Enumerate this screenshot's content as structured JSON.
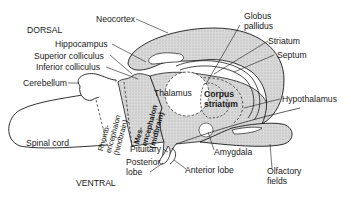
{
  "orientation": {
    "dorsal": "DORSAL",
    "ventral": "VENTRAL"
  },
  "labels": {
    "neocortex": "Neocortex",
    "hippocampus": "Hippocampus",
    "superior_colliculus": "Superior colliculus",
    "inferior_colliculus": "Inferior colliculus",
    "cerebellum": "Cerebellum",
    "spinal_cord": "Spinal cord",
    "rhombencephalon": "Rhomb-\nencephalon\n(hindbrain)",
    "mesencephalon": "Mes-\nencephalon\n(midbrain)",
    "thalamus": "Thalamus",
    "corpus_striatum": "Corpus\nstriatum",
    "globus_pallidus": "Globus\npallidus",
    "striatum": "Striatum",
    "septum": "Septum",
    "hypothalamus": "Hypothalamus",
    "amygdala": "Amygdala",
    "olfactory_fields": "Olfactory\nfields",
    "pituitary": "Pituitary",
    "posterior_lobe": "Posterior\nlobe",
    "anterior_lobe": "Anterior lobe"
  },
  "colors": {
    "outline": "#1a1a1a",
    "stipple": "#cfcfcf",
    "background": "#ffffff"
  }
}
